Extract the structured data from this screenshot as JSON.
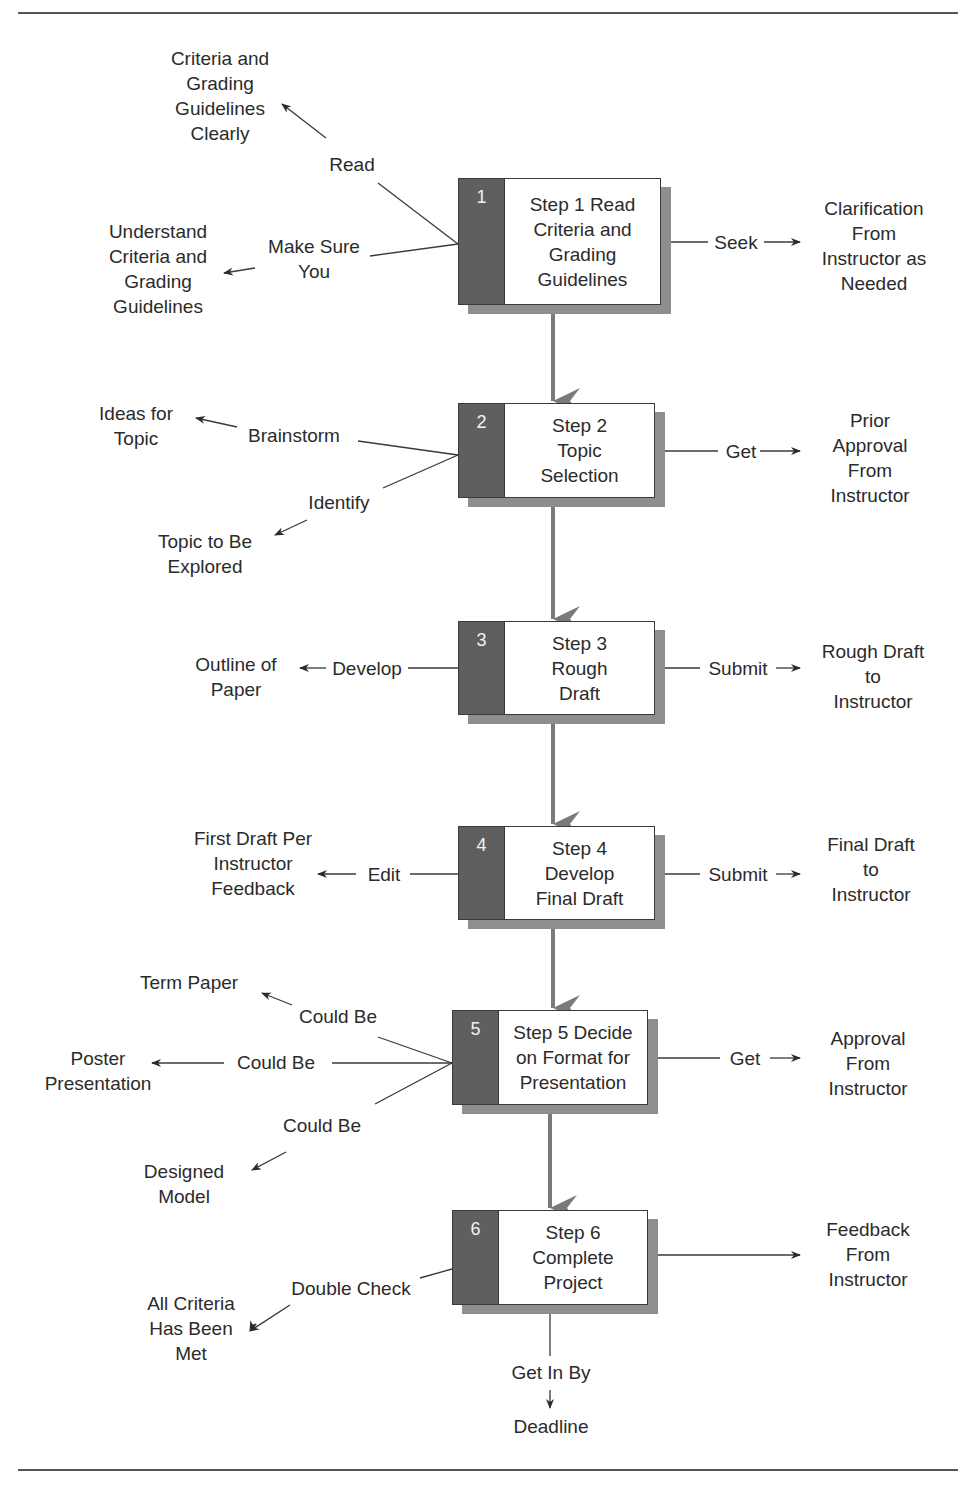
{
  "diagram": {
    "type": "flowchart",
    "steps": [
      {
        "number": "1",
        "title": "Step 1 Read\nCriteria and\nGrading\nGuidelines",
        "left_actions": [
          {
            "verb": "Read",
            "target": "Criteria and\nGrading\nGuidelines\nClearly"
          },
          {
            "verb": "Make Sure\nYou",
            "target": "Understand\nCriteria and\nGrading\nGuidelines"
          }
        ],
        "right_action": {
          "verb": "Seek",
          "target": "Clarification\nFrom\nInstructor as\nNeeded"
        }
      },
      {
        "number": "2",
        "title": "Step 2\nTopic\nSelection",
        "left_actions": [
          {
            "verb": "Brainstorm",
            "target": "Ideas for\nTopic"
          },
          {
            "verb": "Identify",
            "target": "Topic to Be\nExplored"
          }
        ],
        "right_action": {
          "verb": "Get",
          "target": "Prior\nApproval\nFrom\nInstructor"
        }
      },
      {
        "number": "3",
        "title": "Step 3\nRough\nDraft",
        "left_actions": [
          {
            "verb": "Develop",
            "target": "Outline of\nPaper"
          }
        ],
        "right_action": {
          "verb": "Submit",
          "target": "Rough Draft\nto\nInstructor"
        }
      },
      {
        "number": "4",
        "title": "Step 4\nDevelop\nFinal Draft",
        "left_actions": [
          {
            "verb": "Edit",
            "target": "First Draft Per\nInstructor\nFeedback"
          }
        ],
        "right_action": {
          "verb": "Submit",
          "target": "Final Draft\nto\nInstructor"
        }
      },
      {
        "number": "5",
        "title": "Step 5 Decide\non Format for\nPresentation",
        "left_actions": [
          {
            "verb": "Could Be",
            "target": "Term Paper"
          },
          {
            "verb": "Could Be",
            "target": "Poster\nPresentation"
          },
          {
            "verb": "Could Be",
            "target": "Designed\nModel"
          }
        ],
        "right_action": {
          "verb": "Get",
          "target": "Approval\nFrom\nInstructor"
        }
      },
      {
        "number": "6",
        "title": "Step 6\nComplete\nProject",
        "left_actions": [
          {
            "verb": "Double Check",
            "target": "All Criteria\nHas Been\nMet"
          }
        ],
        "right_action": {
          "verb": "",
          "target": "Feedback\nFrom\nInstructor"
        },
        "bottom_action": {
          "verb": "Get In By",
          "target": "Deadline"
        }
      }
    ]
  },
  "colors": {
    "number_band": "#5f5f5f",
    "shadow": "#8e8e8e",
    "connector": "#7a7a7a",
    "line": "#3a3a3a",
    "text": "#2b2b2b"
  }
}
